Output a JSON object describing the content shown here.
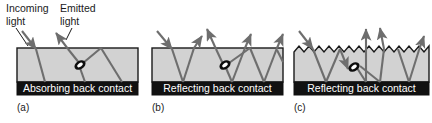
{
  "figure": {
    "title_annotations": {
      "incoming_light": "Incoming\nlight",
      "incoming_light_line1": "Incoming",
      "incoming_light_line2": "light",
      "emitted_light_line1": "Emitted",
      "emitted_light_line2": "light"
    },
    "colors": {
      "absorber_gray": "#d2d2d2",
      "absorber_gray_dark": "#bdbdbd",
      "back_contact_black": "#111111",
      "ray_gray": "#6e6e6e",
      "outline_black": "#1a1a1a",
      "label_white": "#ffffff",
      "background_white": "#ffffff"
    },
    "panels": [
      {
        "id": "a",
        "caption": "(a)",
        "contact_label": "Absorbing back contact",
        "top_surface": "flat",
        "back_contact": "absorbing",
        "has_incoming_ray": true,
        "has_emitted_ray": true,
        "luminescent_center": true,
        "escaped_ray_count": 1,
        "internal_bounce_count": 2
      },
      {
        "id": "b",
        "caption": "(b)",
        "contact_label": "Reflecting back contact",
        "top_surface": "flat",
        "back_contact": "reflecting",
        "has_incoming_ray": true,
        "has_emitted_ray": true,
        "luminescent_center": true,
        "escaped_ray_count": 3,
        "internal_bounce_count": 4
      },
      {
        "id": "c",
        "caption": "(c)",
        "contact_label": "Reflecting back contact",
        "top_surface": "textured-sawtooth",
        "back_contact": "reflecting",
        "has_incoming_ray": true,
        "has_emitted_ray": true,
        "luminescent_center": true,
        "escaped_ray_count": 3,
        "internal_bounce_count": 5,
        "sawtooth_teeth": 13
      }
    ]
  }
}
